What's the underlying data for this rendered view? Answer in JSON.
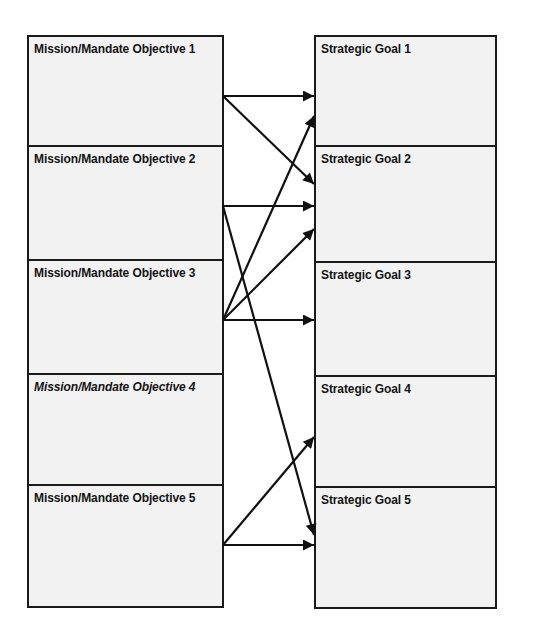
{
  "diagram": {
    "left_column": {
      "items": [
        {
          "label": "Mission/Mandate Objective 1",
          "italic": false
        },
        {
          "label": "Mission/Mandate Objective 2",
          "italic": false
        },
        {
          "label": "Mission/Mandate Objective 3",
          "italic": false
        },
        {
          "label": "Mission/Mandate Objective 4",
          "italic": true
        },
        {
          "label": "Mission/Mandate Objective 5",
          "italic": false
        }
      ]
    },
    "right_column": {
      "items": [
        {
          "label": "Strategic Goal 1"
        },
        {
          "label": "Strategic Goal 2"
        },
        {
          "label": "Strategic Goal 3"
        },
        {
          "label": "Strategic Goal 4"
        },
        {
          "label": "Strategic Goal 5"
        }
      ]
    },
    "connections": [
      {
        "from": "Mission/Mandate Objective 1",
        "to": "Strategic Goal 1"
      },
      {
        "from": "Mission/Mandate Objective 1",
        "to": "Strategic Goal 2"
      },
      {
        "from": "Mission/Mandate Objective 2",
        "to": "Strategic Goal 2"
      },
      {
        "from": "Mission/Mandate Objective 2",
        "to": "Strategic Goal 5"
      },
      {
        "from": "Mission/Mandate Objective 3",
        "to": "Strategic Goal 1"
      },
      {
        "from": "Mission/Mandate Objective 3",
        "to": "Strategic Goal 2"
      },
      {
        "from": "Mission/Mandate Objective 3",
        "to": "Strategic Goal 3"
      },
      {
        "from": "Mission/Mandate Objective 5",
        "to": "Strategic Goal 4"
      },
      {
        "from": "Mission/Mandate Objective 5",
        "to": "Strategic Goal 5"
      }
    ],
    "colors": {
      "box_fill": "#f2f2f2",
      "stroke": "#1a1a1a",
      "text": "#141414",
      "background": "#ffffff"
    }
  }
}
